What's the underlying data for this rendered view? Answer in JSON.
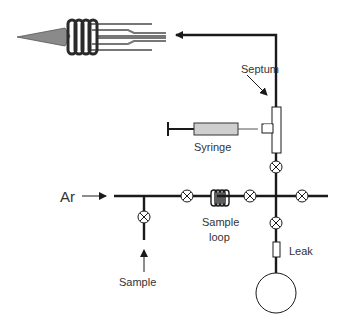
{
  "diagram": {
    "labels": {
      "ar": "Ar",
      "septum": "Septum",
      "syringe": "Syringe",
      "sample_loop_line1": "Sample",
      "sample_loop_line2": "loop",
      "leak": "Leak",
      "sample": "Sample"
    },
    "colors": {
      "line": "#1a1a1a",
      "syringe_fill": "#cfcfcf",
      "torch_cone": "#8a8a8a",
      "text": "#333333"
    },
    "components": [
      {
        "id": "torch",
        "type": "plasma-torch-with-coil"
      },
      {
        "id": "septum",
        "type": "tee-fitting"
      },
      {
        "id": "syringe",
        "type": "syringe"
      },
      {
        "id": "valve-sample",
        "type": "valve"
      },
      {
        "id": "valve-inlet",
        "type": "valve"
      },
      {
        "id": "sample-loop",
        "type": "coil"
      },
      {
        "id": "valve-loop-out",
        "type": "valve"
      },
      {
        "id": "valve-upper",
        "type": "valve"
      },
      {
        "id": "valve-right",
        "type": "valve"
      },
      {
        "id": "valve-lower",
        "type": "valve"
      },
      {
        "id": "leak",
        "type": "restrictor"
      },
      {
        "id": "reservoir",
        "type": "vessel"
      }
    ]
  }
}
